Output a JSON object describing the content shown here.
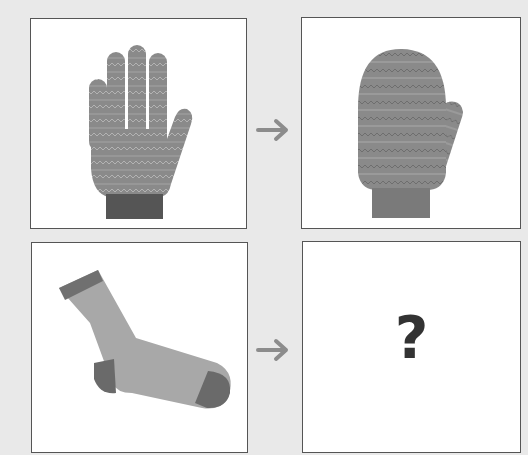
{
  "puzzle": {
    "panels": [
      {
        "id": "top-left",
        "item": "glove",
        "icon": "glove-icon"
      },
      {
        "id": "top-right",
        "item": "mitten",
        "icon": "mitten-icon"
      },
      {
        "id": "bottom-left",
        "item": "sock",
        "icon": "sock-icon"
      },
      {
        "id": "bottom-right",
        "item": "unknown",
        "label": "?"
      }
    ],
    "arrows": [
      {
        "icon": "arrow-right-icon"
      },
      {
        "icon": "arrow-right-icon"
      }
    ]
  },
  "colors": {
    "background": "#e9e9e9",
    "knit": "#8a8a8a",
    "cuff": "#555555",
    "arrow": "#8c8c8c",
    "question": "#333333"
  }
}
